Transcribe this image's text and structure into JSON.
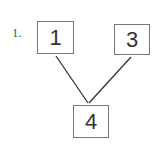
{
  "problem": {
    "number_label": "1.",
    "boxes": [
      {
        "id": "top-left",
        "value": "1"
      },
      {
        "id": "top-right",
        "value": "3"
      },
      {
        "id": "bottom",
        "value": "4"
      }
    ],
    "connections": [
      {
        "from": "top-left",
        "to": "bottom"
      },
      {
        "from": "top-right",
        "to": "bottom"
      }
    ]
  }
}
